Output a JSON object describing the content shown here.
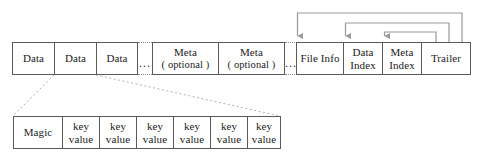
{
  "diagram": {
    "colors": {
      "box_border": "#5a5a5a",
      "connector": "#9a9a9a",
      "leader": "#b5b5b5",
      "text": "#1b1b1b",
      "background": "#ffffff"
    },
    "main_row": {
      "data_blocks": [
        {
          "label": "Data"
        },
        {
          "label": "Data"
        },
        {
          "label": "Data"
        }
      ],
      "gap_1": {
        "label": "..."
      },
      "meta_blocks": [
        {
          "line1": "Meta",
          "line2": "( optional )"
        },
        {
          "line1": "Meta",
          "line2": "( optional )"
        }
      ],
      "gap_2": {
        "label": "..."
      },
      "trailing_blocks": [
        {
          "line1": "File Info",
          "line2": ""
        },
        {
          "line1": "Data",
          "line2": "Index"
        },
        {
          "line1": "Meta",
          "line2": "Index"
        },
        {
          "line1": "Trailer",
          "line2": ""
        }
      ]
    },
    "detail_row": {
      "cells": [
        {
          "line1": "Magic",
          "line2": ""
        },
        {
          "line1": "key",
          "line2": "value"
        },
        {
          "line1": "key",
          "line2": "value"
        },
        {
          "line1": "key",
          "line2": "value"
        },
        {
          "line1": "key",
          "line2": "value"
        },
        {
          "line1": "key",
          "line2": "value"
        },
        {
          "line1": "key",
          "line2": "value"
        }
      ]
    },
    "connectors": [
      {
        "from": "trailer",
        "to": "file-info"
      },
      {
        "from": "trailer",
        "to": "data-index"
      },
      {
        "from": "trailer",
        "to": "meta-index"
      }
    ]
  }
}
